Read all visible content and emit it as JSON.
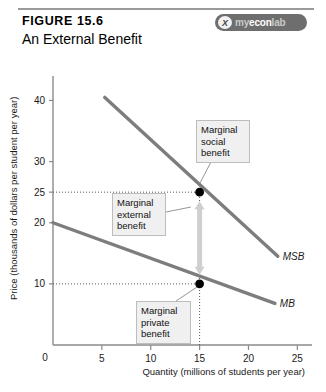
{
  "header": {
    "figure_label": "FIGURE 15.6",
    "figure_title": "An External Benefit",
    "badge": {
      "mark": "X",
      "part1": "my",
      "part2": "econ",
      "part3": "lab",
      "full_text": "myeconlab"
    }
  },
  "chart_data": {
    "type": "line",
    "title": "An External Benefit",
    "xlabel": "Quantity (millions of students per year)",
    "ylabel": "Price (thousands of dollars per student per year)",
    "xlim": [
      0,
      26.5
    ],
    "ylim": [
      0,
      44
    ],
    "grid": false,
    "legend_position": "inline-right",
    "xticks": [
      0,
      5,
      10,
      15,
      20,
      25
    ],
    "xtick_labels": [
      "0",
      "5",
      "10",
      "15",
      "20",
      "25"
    ],
    "yticks": [
      10,
      20,
      25,
      30,
      40
    ],
    "ytick_labels": [
      "10",
      "20",
      "25",
      "30",
      "40"
    ],
    "y_origin_label": "0",
    "series": [
      {
        "name": "MSB",
        "label": "MSB",
        "description": "Marginal social benefit curve",
        "x": [
          5.3,
          23.0
        ],
        "y": [
          40.5,
          14.5
        ]
      },
      {
        "name": "MB",
        "label": "MB",
        "description": "Marginal private benefit curve",
        "x": [
          0.0,
          22.7
        ],
        "y": [
          20.0,
          6.8
        ]
      }
    ],
    "points": [
      {
        "name": "marginal-social-benefit-point",
        "x": 15,
        "y": 25
      },
      {
        "name": "marginal-private-benefit-point",
        "x": 15,
        "y": 10
      }
    ],
    "guides": [
      {
        "name": "guide-price-25",
        "type": "horizontal",
        "value": 25,
        "from_x": 0,
        "to_x": 15
      },
      {
        "name": "guide-price-10",
        "type": "horizontal",
        "value": 10,
        "from_x": 0,
        "to_x": 15
      },
      {
        "name": "guide-quantity-15",
        "type": "vertical",
        "value": 15,
        "from_y": 0,
        "to_y": 25
      }
    ],
    "annotations": [
      {
        "name": "marginal-social-benefit",
        "text": "Marginal\nsocial\nbenefit",
        "target_x": 15,
        "target_y": 25
      },
      {
        "name": "marginal-external-benefit",
        "text": "Marginal\nexternal\nbenefit",
        "target_x": 15,
        "target_y": 17.5
      },
      {
        "name": "marginal-private-benefit",
        "text": "Marginal\nprivate\nbenefit",
        "target_x": 15,
        "target_y": 10
      }
    ],
    "measure_arrow": {
      "name": "marginal-external-benefit-arrow",
      "x": 15,
      "from_y": 10,
      "to_y": 25,
      "value": 15
    }
  }
}
